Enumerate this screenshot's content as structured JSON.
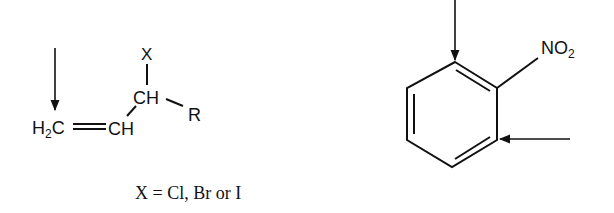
{
  "diagram": {
    "left_molecule": {
      "name": "allylic halide",
      "atoms": {
        "h2c": "H",
        "h2c_sub": "2",
        "h2c_c": "C",
        "ch_lower": "CH",
        "ch_upper": "CH",
        "x": "X",
        "r": "R"
      },
      "caption": "X = Cl, Br or I"
    },
    "right_molecule": {
      "name": "nitrobenzene",
      "substituent": "NO",
      "substituent_sub": "2"
    },
    "colors": {
      "ink": "#111111",
      "background": "#ffffff"
    }
  }
}
